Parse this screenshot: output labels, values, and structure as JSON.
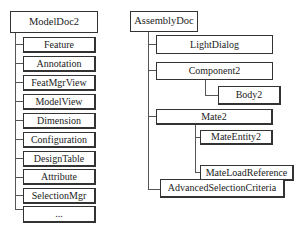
{
  "diagram": {
    "left_tree": {
      "root": "ModelDoc2",
      "children": [
        "Feature",
        "Annotation",
        "FeatMgrView",
        "ModelView",
        "Dimension",
        "Configuration",
        "DesignTable",
        "Attribute",
        "SelectionMgr",
        "..."
      ]
    },
    "right_tree": {
      "root": "AssemblyDoc",
      "light_dialog": "LightDialog",
      "component2": "Component2",
      "body2": "Body2",
      "mate2": "Mate2",
      "mate_entity2": "MateEntity2",
      "mate_load_reference": "MateLoadReference",
      "advanced_selection_criteria": "AdvancedSelectionCriteria"
    }
  }
}
